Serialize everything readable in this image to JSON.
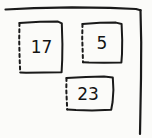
{
  "diagram": {
    "style": "hand-drawn sketch",
    "background_color": "#fbfbf9",
    "ink_color": "#1a1a1a",
    "frame": {
      "name": "outer-frame",
      "description": "open hand-drawn frame: horizontal line across the top and vertical line down the right side; left and bottom sides are open",
      "sides_drawn": [
        "top",
        "right"
      ],
      "line_style": "solid"
    },
    "boxes": [
      {
        "id": "box-17",
        "value": "17",
        "position": "upper-left",
        "border_style": "solid on top, right and bottom; dashed on left",
        "dashed_side": "left"
      },
      {
        "id": "box-5",
        "value": "5",
        "position": "upper-right",
        "border_style": "solid on top, right and bottom; dashed on left",
        "dashed_side": "left"
      },
      {
        "id": "box-23",
        "value": "23",
        "position": "lower-center",
        "border_style": "solid on top, right and bottom; dashed on left",
        "dashed_side": "left"
      }
    ]
  }
}
